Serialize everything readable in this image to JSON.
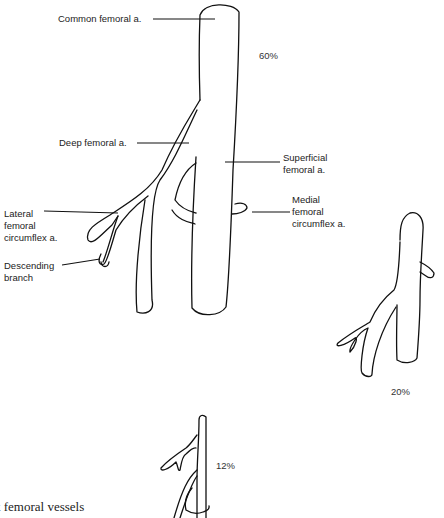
{
  "diagram": {
    "main": {
      "labels": {
        "common_femoral": "Common femoral a.",
        "deep_femoral": "Deep femoral a.",
        "superficial_femoral": "Superficial\nfemoral a.",
        "medial_circumflex": "Medial\nfemoral\ncircumflex a.",
        "lateral_circumflex": "Lateral\nfemoral\ncircumflex a.",
        "descending_branch": "Descending\nbranch"
      },
      "percentage": "60%"
    },
    "variant_right": {
      "percentage": "20%"
    },
    "variant_bottom": {
      "percentage": "12%"
    },
    "caption": "k femoral vessels"
  }
}
